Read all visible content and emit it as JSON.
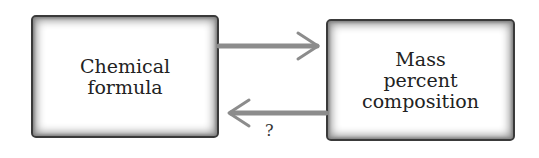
{
  "diagram": {
    "nodes": [
      {
        "id": "chemical-formula",
        "lines": [
          "Chemical",
          "formula"
        ]
      },
      {
        "id": "mass-percent-composition",
        "lines": [
          "Mass",
          "percent",
          "composition"
        ]
      }
    ],
    "edges": [
      {
        "from": "chemical-formula",
        "to": "mass-percent-composition",
        "label": ""
      },
      {
        "from": "mass-percent-composition",
        "to": "chemical-formula",
        "label": "?"
      }
    ],
    "colors": {
      "arrow": "#8c8c8c",
      "border": "#3a3a3a",
      "text": "#222222"
    }
  }
}
